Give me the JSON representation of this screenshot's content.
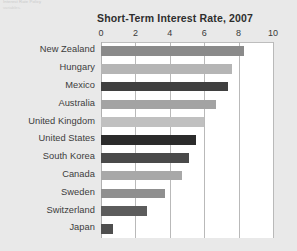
{
  "page": {
    "background_color": "#e9e9e9",
    "corner_note_line1": "Interest Rate Policy",
    "corner_note_line2": "variables."
  },
  "chart_data": {
    "type": "bar",
    "orientation": "horizontal",
    "title": "Short-Term Interest Rate, 2007",
    "xlabel": "",
    "ylabel": "",
    "xlim": [
      0,
      10
    ],
    "xticks": [
      "0",
      "2",
      "4",
      "6",
      "8",
      "10"
    ],
    "grid": "vertical",
    "legend": "none",
    "plot_background": "#ffffff",
    "categories": [
      "New Zealand",
      "Hungary",
      "Mexico",
      "Australia",
      "United Kingdom",
      "United States",
      "South Korea",
      "Canada",
      "Sweden",
      "Switzerland",
      "Japan"
    ],
    "values": [
      8.3,
      7.6,
      7.4,
      6.7,
      6.0,
      5.5,
      5.1,
      4.7,
      3.7,
      2.7,
      0.7
    ],
    "bar_colors": [
      "#8a8a8a",
      "#b5b5b5",
      "#3f3f3f",
      "#a3a3a3",
      "#c0c0c0",
      "#2b2b2b",
      "#4a4a4a",
      "#a8a8a8",
      "#8f8f8f",
      "#5c5c5c",
      "#4f4f4f"
    ]
  }
}
